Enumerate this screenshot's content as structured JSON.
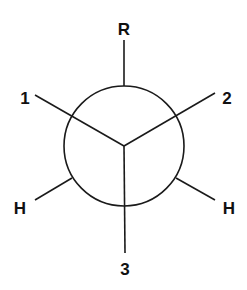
{
  "diagram": {
    "type": "newman-projection",
    "colors": {
      "stroke": "#1a1a1a",
      "background": "#ffffff",
      "text": "#111111"
    },
    "front_carbon": {
      "bonds": [
        {
          "label": "1",
          "direction": "upper-left"
        },
        {
          "label": "2",
          "direction": "upper-right"
        },
        {
          "label": "3",
          "direction": "down"
        }
      ]
    },
    "back_carbon": {
      "bonds": [
        {
          "label": "R",
          "direction": "up"
        },
        {
          "label": "H",
          "direction": "lower-left"
        },
        {
          "label": "H",
          "direction": "lower-right"
        }
      ]
    },
    "labels": {
      "top": "R",
      "upper_left": "1",
      "upper_right": "2",
      "lower_left": "H",
      "lower_right": "H",
      "bottom": "3"
    }
  }
}
